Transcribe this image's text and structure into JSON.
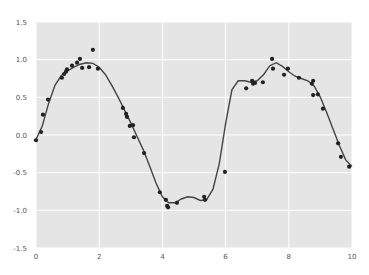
{
  "chart_data": {
    "type": "scatter",
    "title": "",
    "xlabel": "",
    "ylabel": "",
    "xlim": [
      0,
      10
    ],
    "ylim": [
      -1.5,
      1.5
    ],
    "grid": true,
    "legend": null,
    "x_ticks": [
      0,
      2,
      4,
      6,
      8,
      10
    ],
    "x_tick_labels": [
      "0",
      "2",
      "4",
      "6",
      "8",
      "10"
    ],
    "y_ticks": [
      1.5,
      1.0,
      0.5,
      0.0,
      -0.5,
      -1.0,
      -1.5
    ],
    "y_tick_labels": [
      "1.5",
      "1.0",
      "0.5",
      "0.0",
      "-0.5",
      "-1.0",
      "-1.5"
    ],
    "series": [
      {
        "name": "data",
        "kind": "scatter",
        "color": "#222222",
        "x": [
          0.0,
          0.16,
          0.22,
          0.38,
          0.82,
          0.89,
          0.95,
          0.98,
          1.14,
          1.3,
          1.39,
          1.46,
          1.68,
          1.8,
          1.96,
          2.75,
          2.85,
          2.88,
          2.97,
          3.07,
          3.1,
          3.42,
          3.92,
          4.11,
          4.15,
          4.18,
          4.46,
          5.32,
          5.35,
          5.98,
          6.65,
          6.84,
          6.87,
          6.93,
          7.18,
          7.47,
          7.5,
          7.85,
          7.97,
          8.32,
          8.73,
          8.77,
          8.77,
          8.92,
          9.08,
          9.56,
          9.65,
          9.91
        ],
        "y": [
          -0.07,
          0.04,
          0.27,
          0.47,
          0.76,
          0.81,
          0.84,
          0.87,
          0.92,
          0.96,
          1.01,
          0.89,
          0.9,
          1.13,
          0.88,
          0.36,
          0.28,
          0.24,
          0.12,
          0.13,
          -0.03,
          -0.24,
          -0.76,
          -0.86,
          -0.94,
          -0.96,
          -0.9,
          -0.82,
          -0.86,
          -0.49,
          0.62,
          0.72,
          0.68,
          0.69,
          0.7,
          1.01,
          0.88,
          0.8,
          0.88,
          0.76,
          0.68,
          0.72,
          0.53,
          0.54,
          0.35,
          -0.11,
          -0.29,
          -0.42
        ]
      },
      {
        "name": "fit",
        "kind": "line",
        "color": "#444444",
        "x": [
          0.0,
          0.2,
          0.4,
          0.6,
          0.8,
          1.0,
          1.2,
          1.4,
          1.6,
          1.8,
          2.0,
          2.2,
          2.4,
          2.6,
          2.8,
          3.0,
          3.2,
          3.4,
          3.6,
          3.8,
          4.0,
          4.2,
          4.4,
          4.6,
          4.8,
          5.0,
          5.2,
          5.4,
          5.6,
          5.8,
          6.0,
          6.2,
          6.4,
          6.6,
          6.8,
          7.0,
          7.2,
          7.4,
          7.6,
          7.8,
          8.0,
          8.2,
          8.4,
          8.6,
          8.8,
          9.0,
          9.2,
          9.4,
          9.6,
          9.8,
          10.0
        ],
        "y": [
          -0.06,
          0.12,
          0.42,
          0.66,
          0.79,
          0.85,
          0.9,
          0.94,
          0.96,
          0.95,
          0.9,
          0.8,
          0.66,
          0.5,
          0.33,
          0.16,
          -0.02,
          -0.2,
          -0.42,
          -0.64,
          -0.82,
          -0.9,
          -0.9,
          -0.85,
          -0.82,
          -0.83,
          -0.87,
          -0.86,
          -0.72,
          -0.38,
          0.15,
          0.6,
          0.72,
          0.72,
          0.7,
          0.72,
          0.8,
          0.92,
          0.96,
          0.91,
          0.84,
          0.78,
          0.75,
          0.72,
          0.65,
          0.5,
          0.3,
          0.08,
          -0.14,
          -0.33,
          -0.42
        ]
      }
    ]
  },
  "style": {
    "plot_bg": "#e5e5e5",
    "grid_color": "#ffffff",
    "page_bg": "#ffffff"
  }
}
